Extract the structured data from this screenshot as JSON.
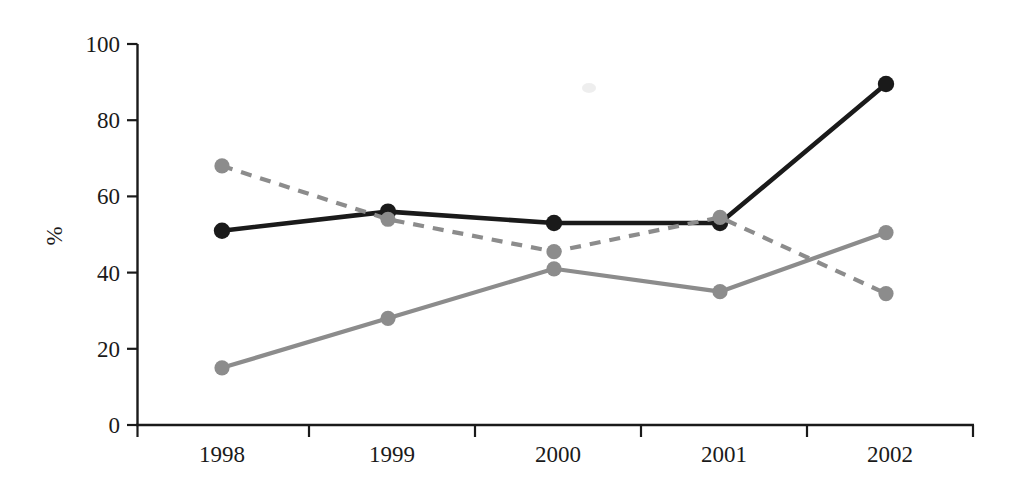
{
  "chart_data": {
    "type": "line",
    "title": "",
    "subtitle": "",
    "xlabel": "",
    "ylabel": "%",
    "categories": [
      "1998",
      "1999",
      "2000",
      "2001",
      "2002"
    ],
    "x": [
      1998,
      1999,
      2000,
      2001,
      2002
    ],
    "ylim": [
      0,
      100
    ],
    "yticks": [
      0,
      20,
      40,
      60,
      80,
      100
    ],
    "ytick_labels": [
      "0",
      "20",
      "40",
      "60",
      "80",
      "100"
    ],
    "xtick_labels": [
      "1998",
      "1999",
      "2000",
      "2001",
      "2002"
    ],
    "grid": false,
    "legend": "none",
    "legend_position": "none",
    "annotations": [],
    "series": [
      {
        "name": "series-black-solid",
        "style": "solid",
        "color": "#1a1a1a",
        "marker": "circle",
        "values": [
          51,
          56,
          53,
          53,
          89.5
        ]
      },
      {
        "name": "series-gray-dashed",
        "style": "dashed",
        "color": "#8c8c8c",
        "marker": "circle",
        "values": [
          68,
          54,
          45.5,
          54.5,
          34.5
        ]
      },
      {
        "name": "series-gray-solid",
        "style": "solid",
        "color": "#8c8c8c",
        "marker": "circle",
        "values": [
          15,
          28,
          41,
          35,
          50.5
        ]
      }
    ]
  },
  "axes": {
    "y_axis_label": "%",
    "y_tick_0": "0",
    "y_tick_20": "20",
    "y_tick_40": "40",
    "y_tick_60": "60",
    "y_tick_80": "80",
    "y_tick_100": "100",
    "x_tick_1": "1998",
    "x_tick_2": "1999",
    "x_tick_3": "2000",
    "x_tick_4": "2001",
    "x_tick_5": "2002"
  }
}
